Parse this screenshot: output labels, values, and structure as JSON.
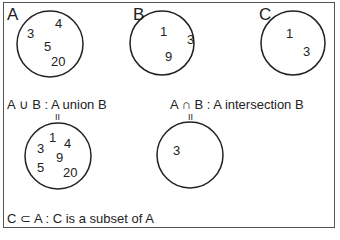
{
  "sets": {
    "A": {
      "label": "A",
      "elements": [
        "3",
        "4",
        "5",
        "20"
      ]
    },
    "B": {
      "label": "B",
      "elements": [
        "1",
        "3",
        "9"
      ]
    },
    "C": {
      "label": "C",
      "elements": [
        "1",
        "3"
      ]
    }
  },
  "union": {
    "caption": "A ∪ B : A union B",
    "equals": "II",
    "elements": [
      "1",
      "4",
      "3",
      "9",
      "5",
      "20"
    ]
  },
  "intersection": {
    "caption": "A ∩ B : A intersection B",
    "equals": "II",
    "elements": [
      "3"
    ]
  },
  "subset": {
    "caption": "C ⊂ A : C is a subset of A"
  }
}
